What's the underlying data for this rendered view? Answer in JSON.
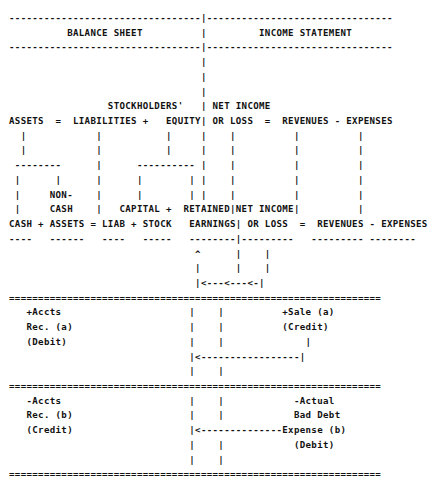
{
  "document": {
    "type": "ascii-art-diagram",
    "title": "Accounting Equation Expansion Diagram",
    "font_weight": "bold",
    "text_color": "#111111",
    "background_color": "#ffffff"
  },
  "headers": {
    "left_panel": "BALANCE SHEET",
    "right_panel": "INCOME STATEMENT",
    "divider_char": "|",
    "rule_char": "-"
  },
  "equations": {
    "balance_sheet_top": {
      "terms": [
        "ASSETS",
        "LIABILITIES",
        "STOCKHOLDERS'",
        "EQUITY"
      ],
      "operators": [
        "=",
        "+"
      ],
      "rendered": "ASSETS  =  LIABILITIES +   EQUITY"
    },
    "income_statement_top": {
      "terms": [
        "NET INCOME",
        "OR LOSS",
        "REVENUES",
        "EXPENSES"
      ],
      "operators": [
        "=",
        "-"
      ],
      "rendered": "NET INCOME / OR LOSS  =  REVENUES - EXPENSES"
    },
    "balance_sheet_expanded": {
      "terms": [
        "CASH",
        "NON-CASH ASSETS",
        "LIAB",
        "STOCK",
        "CAPITAL",
        "RETAINED EARNINGS"
      ],
      "operators": [
        "+",
        "=",
        "+",
        "+"
      ],
      "rendered": "CASH + ASSETS = LIAB + STOCK          EARNINGS"
    },
    "income_statement_expanded": {
      "terms": [
        "NET INCOME",
        "OR LOSS",
        "REVENUES",
        "EXPENSES"
      ],
      "operators": [
        "=",
        "-"
      ],
      "rendered": "NET INCOME / OR LOSS  =  REVENUES - EXPENSES"
    }
  },
  "transactions": [
    {
      "id": "a",
      "label": "Credit Sale",
      "left_side": [
        "+Accts",
        "Rec. (a)",
        "(Debit)"
      ],
      "right_side": [
        "+Sale (a)",
        "(Credit)"
      ]
    },
    {
      "id": "b",
      "label": "Bad Debt Write-off",
      "left_side": [
        "-Accts",
        "Rec. (b)",
        "(Credit)"
      ],
      "right_side": [
        "-Actual",
        "Bad Debt",
        "Expense (b)",
        "(Debit)"
      ]
    }
  ],
  "connectors": {
    "feedback_arrow": "|<---<---<-|",
    "caret": "^",
    "transaction_arrow_a": "|<-------------------|",
    "transaction_arrow_b": "|<---------------------------Expense (b)",
    "heavy_rule_char": "=",
    "light_rule_char": "-",
    "vertical_char": "|"
  },
  "art": " ------------------------------|------------------------------\n       BALANCE SHEET          |        INCOME STATEMENT\n ------------------------------|------------------------------\n                              |\n                              |\n                              |\n                 STOCKHOLDERS' | NET INCOME\n ASSETS  =  LIABILITIES +   EQUITY  | OR LOSS  =  REVENUES - EXPENSES\n"
}
